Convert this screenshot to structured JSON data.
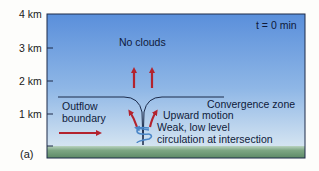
{
  "figure": {
    "panel_label": "(a)",
    "time_label": "t = 0 min",
    "y_axis": {
      "ticks": [
        "4 km",
        "3 km",
        "2 km",
        "1 km"
      ]
    },
    "annotations": {
      "no_clouds": "No clouds",
      "outflow_line1": "Outflow",
      "outflow_line2": "boundary",
      "convergence_zone": "Convergence zone",
      "upward_motion": "Upward motion",
      "circulation_line1": "Weak, low level",
      "circulation_line2": "circulation at intersection"
    },
    "colors": {
      "sky_top": "#5d92dc",
      "sky_bottom": "#cfe0f0",
      "ground": "#6f9a77",
      "arrow_red": "#b3232e",
      "spiral_blue": "#4a86c8",
      "boundary_line": "#1b2a4a"
    }
  }
}
